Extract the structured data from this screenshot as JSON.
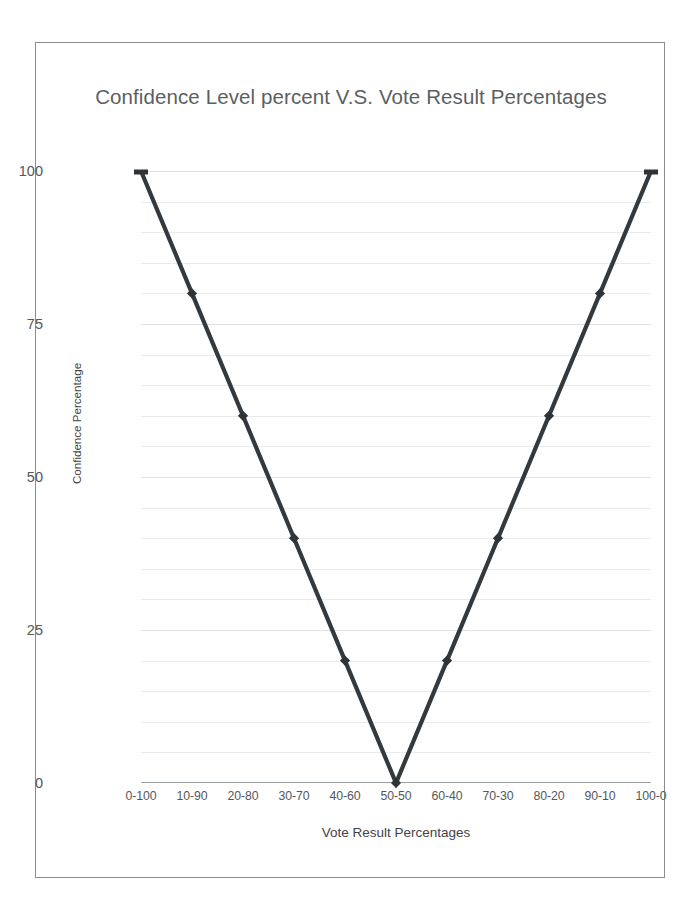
{
  "document": {
    "background_color": "#ffffff",
    "frame_border_color": "#8a8d90"
  },
  "chart": {
    "title": "Confidence Level percent V.S. Vote Result\nPercentages",
    "x_axis_title": "Vote Result Percentages",
    "y_axis_title": "Confidence Percentage",
    "line_color": "#34393d",
    "marker_color": "#2e3336",
    "gridline_color": "#e9eaec",
    "axis_color": "#9aa0a4",
    "tick_label_color": "#53585c",
    "title_color": "#5b5f63"
  },
  "chart_data": {
    "type": "line",
    "title": "Confidence Level percent V.S. Vote Result Percentages",
    "xlabel": "Vote Result Percentages",
    "ylabel": "Confidence Percentage",
    "categories": [
      "0-100",
      "10-90",
      "20-80",
      "30-70",
      "40-60",
      "50-50",
      "60-40",
      "70-30",
      "80-20",
      "90-10",
      "100-0"
    ],
    "values": [
      100,
      80,
      60,
      40,
      20,
      0,
      20,
      40,
      60,
      80,
      100
    ],
    "series": [
      {
        "name": "Confidence Percentage",
        "values": [
          100,
          80,
          60,
          40,
          20,
          0,
          20,
          40,
          60,
          80,
          100
        ]
      }
    ],
    "ylim": [
      0,
      100
    ],
    "y_major_ticks": [
      0,
      25,
      50,
      75,
      100
    ],
    "y_minor_step": 5,
    "grid": true,
    "legend": "none",
    "markers": true
  }
}
